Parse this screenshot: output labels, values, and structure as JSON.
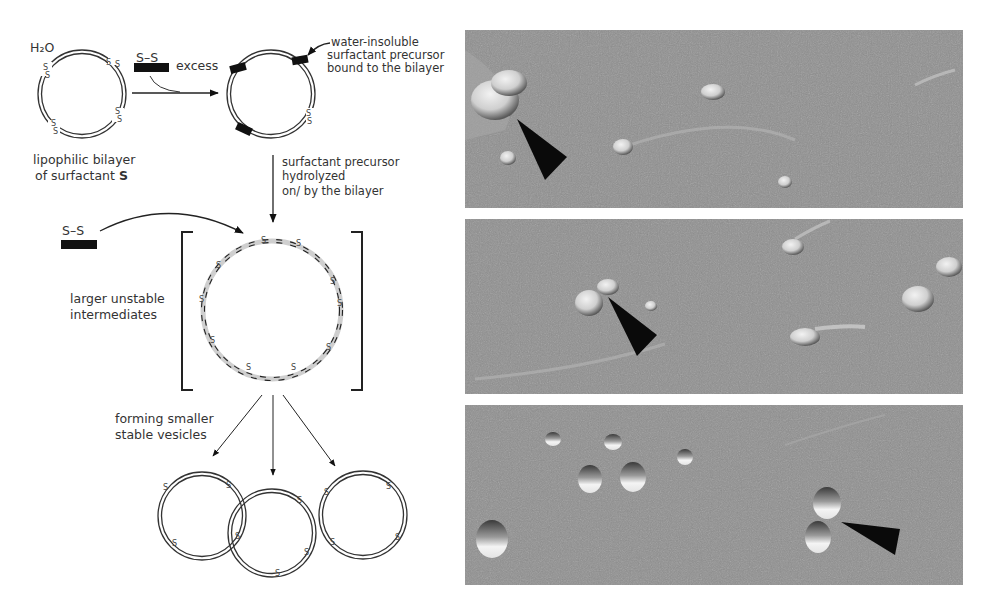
{
  "scheme": {
    "solvent_label": "H₂O",
    "reagent_label": "S–S",
    "excess_label": "excess",
    "initial_vesicle_caption_line1": "lipophilic bilayer",
    "initial_vesicle_caption_line2_prefix": "of surfactant ",
    "initial_vesicle_caption_line2_bold": "S",
    "bound_precursor_note_line1": "water-insoluble",
    "bound_precursor_note_line2": "surfactant precursor",
    "bound_precursor_note_line3": "bound to the bilayer",
    "hydrolysis_step_line1": "surfactant precursor",
    "hydrolysis_step_line2": "hydrolyzed",
    "hydrolysis_step_line3": "on/ by the bilayer",
    "second_reagent_label": "S–S",
    "intermediates_label_line1": "larger unstable",
    "intermediates_label_line2": "intermediates",
    "products_label_line1": "forming smaller",
    "products_label_line2": "stable vesicles",
    "disulfide_glyph": "S"
  },
  "micrographs": [
    {
      "id": "panel-1",
      "description": "freeze-fracture micrograph with small vesicles",
      "arrowhead_count": 1
    },
    {
      "id": "panel-2",
      "description": "freeze-fracture micrograph with budding vesicles",
      "arrowhead_count": 1
    },
    {
      "id": "panel-3",
      "description": "freeze-fracture micrograph with separated small vesicles",
      "arrowhead_count": 1
    }
  ],
  "colors": {
    "background": "#ffffff",
    "ink": "#2a2a2a",
    "micrograph_gray": "#8f8f8f",
    "arrowhead": "#0a0a0a"
  }
}
